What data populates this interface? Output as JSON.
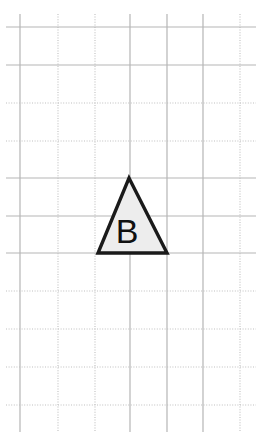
{
  "canvas": {
    "width": 258,
    "height": 437,
    "background_color": "#ffffff"
  },
  "grid": {
    "line_color_solid": "#b5b5b5",
    "line_color_dotted": "#bfbfbf",
    "solid_width": 1.2,
    "dotted_width": 1.1,
    "dot_pattern": "1,1.6",
    "vertical_lines": [
      {
        "x": 20,
        "style": "solid"
      },
      {
        "x": 58,
        "style": "dotted"
      },
      {
        "x": 95,
        "style": "dotted"
      },
      {
        "x": 130,
        "style": "solid"
      },
      {
        "x": 167,
        "style": "solid"
      },
      {
        "x": 203,
        "style": "solid"
      },
      {
        "x": 240,
        "style": "dotted"
      }
    ],
    "horizontal_lines": [
      {
        "y": 27,
        "style": "solid"
      },
      {
        "y": 65,
        "style": "solid"
      },
      {
        "y": 103,
        "style": "dotted"
      },
      {
        "y": 141,
        "style": "dotted"
      },
      {
        "y": 178,
        "style": "solid"
      },
      {
        "y": 216,
        "style": "solid"
      },
      {
        "y": 253,
        "style": "solid"
      },
      {
        "y": 291,
        "style": "dotted"
      },
      {
        "y": 329,
        "style": "dotted"
      },
      {
        "y": 367,
        "style": "dotted"
      },
      {
        "y": 405,
        "style": "dotted"
      }
    ],
    "extent": {
      "x1": 6,
      "x2": 256,
      "y1": 14,
      "y2": 432
    }
  },
  "shapes": [
    {
      "id": "triangle-b",
      "type": "triangle",
      "label": "B",
      "points": "129,178 167,253 98,253",
      "apex": {
        "x": 129,
        "y": 178
      },
      "base_left": {
        "x": 98,
        "y": 253
      },
      "base_right": {
        "x": 167,
        "y": 253
      },
      "fill_color": "#ededed",
      "stroke_color": "#1a1a1a",
      "stroke_width": 3.4,
      "label_x": 127,
      "label_y": 243,
      "label_font_size": 34,
      "label_color": "#111111"
    }
  ]
}
